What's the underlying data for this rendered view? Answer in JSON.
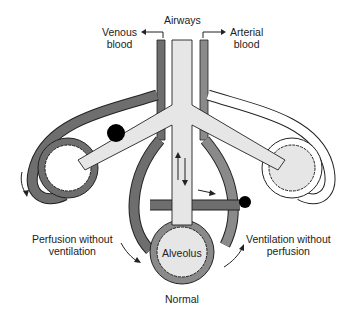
{
  "labels": {
    "airways": "Airways",
    "venous_line1": "Venous",
    "venous_line2": "blood",
    "arterial_line1": "Arterial",
    "arterial_line2": "blood",
    "perfusion_line1": "Perfusion without",
    "perfusion_line2": "ventilation",
    "ventilation_line1": "Ventilation without",
    "ventilation_line2": "perfusion",
    "alveolus": "Alveolus",
    "normal": "Normal"
  },
  "colors": {
    "venous": "#6e6e6e",
    "arterial": "#8a8a8a",
    "airway": "#e6e6e6",
    "outline": "#222222",
    "obstruction": "#000000"
  }
}
